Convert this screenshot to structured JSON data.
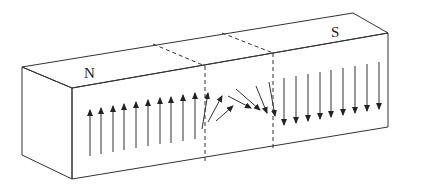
{
  "diagram": {
    "labels": {
      "north": "N",
      "south": "S"
    },
    "colors": {
      "stroke": "#333333",
      "background": "#ffffff"
    },
    "regions": [
      {
        "name": "left-domain",
        "pole": "N",
        "arrow_direction": "up",
        "arrow_count": 10
      },
      {
        "name": "domain-wall",
        "arrow_direction": "rotating",
        "arrow_count": 6
      },
      {
        "name": "right-domain",
        "pole": "S",
        "arrow_direction": "down",
        "arrow_count": 10
      }
    ]
  }
}
